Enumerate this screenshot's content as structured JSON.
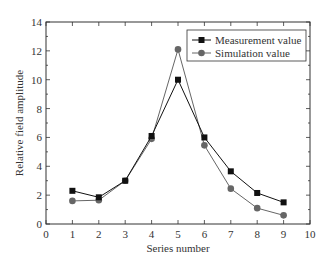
{
  "chart_data": {
    "type": "line",
    "title": "",
    "xlabel": "Series number",
    "ylabel": "Relative field amplitude",
    "xlim": [
      0,
      10
    ],
    "ylim": [
      0,
      14
    ],
    "xticks": [
      0,
      1,
      2,
      3,
      4,
      5,
      6,
      7,
      8,
      9,
      10
    ],
    "yticks": [
      0,
      2,
      4,
      6,
      8,
      10,
      12,
      14
    ],
    "grid": false,
    "legend_position": "upper right",
    "x": [
      1,
      2,
      3,
      4,
      5,
      6,
      7,
      8,
      9
    ],
    "series": [
      {
        "name": "Measurement value",
        "marker": "square",
        "color": "#111111",
        "values": [
          2.3,
          1.85,
          3.0,
          6.1,
          10.0,
          6.0,
          3.65,
          2.15,
          1.5
        ]
      },
      {
        "name": "Simulation value",
        "marker": "circle",
        "color": "#666666",
        "values": [
          1.6,
          1.65,
          3.0,
          5.9,
          12.1,
          5.45,
          2.45,
          1.1,
          0.6
        ]
      }
    ]
  }
}
